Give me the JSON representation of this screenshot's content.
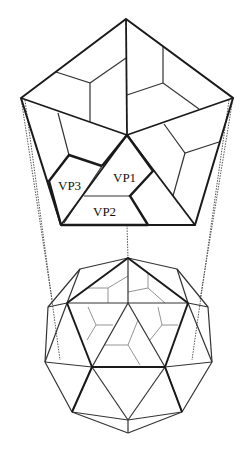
{
  "diagram": {
    "colors": {
      "background": "#ffffff",
      "heavy_line": "#1a1a1a",
      "medium_line": "#333333",
      "light_line": "#777777",
      "dashed_line": "#555555",
      "text": "#111111"
    },
    "labels": [
      {
        "id": "vp1",
        "text": "VP1",
        "x": 113,
        "y": 182
      },
      {
        "id": "vp2",
        "text": "VP2",
        "x": 93,
        "y": 216
      },
      {
        "id": "vp3",
        "text": "VP3",
        "x": 58,
        "y": 190
      }
    ],
    "pentagon": {
      "vertices": [
        [
          126,
          19
        ],
        [
          233,
          98
        ],
        [
          195,
          225
        ],
        [
          61,
          225
        ],
        [
          21,
          98
        ]
      ],
      "center": [
        127,
        135
      ]
    }
  }
}
